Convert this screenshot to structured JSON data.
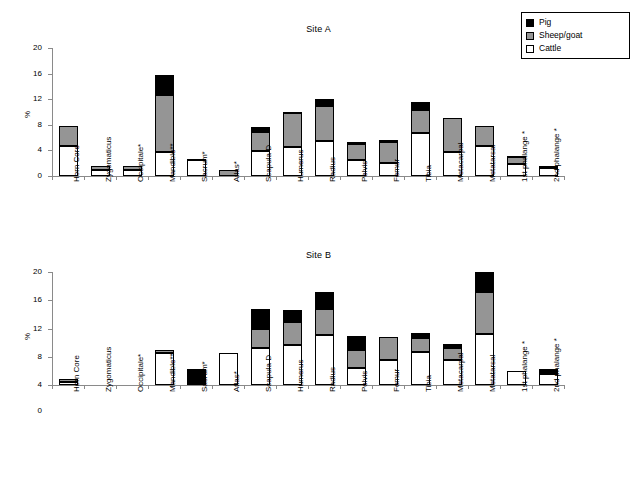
{
  "legend": {
    "position": "top-right",
    "entries": [
      {
        "label": "Pig",
        "color": "#000000",
        "key": "pig"
      },
      {
        "label": "Sheep/goat",
        "color": "#959595",
        "key": "sheep"
      },
      {
        "label": "Cattle",
        "color": "#ffffff",
        "key": "cattle"
      }
    ]
  },
  "chart_data": [
    {
      "type": "bar",
      "stacked": true,
      "title": "Site A",
      "xlabel": "",
      "ylabel": "%",
      "ylim": [
        0,
        20
      ],
      "yticks": [
        0,
        4,
        8,
        12,
        16,
        20
      ],
      "ytick_labels": [
        "0",
        "4",
        "8",
        "12",
        "16",
        "20"
      ],
      "grid": false,
      "axis_baseline_value": 0,
      "categories": [
        "Horn Core",
        "Zygomaticus",
        "Occipitale*",
        "Mandible**",
        "Sacrum*",
        "Atlas*",
        "Scapula D",
        "Humerus",
        "Radius",
        "Pelvis",
        "Femur",
        "Tibia",
        "Metacarpal",
        "Metatarsal",
        "1st  phalange *",
        "2nd phalange *"
      ],
      "series": [
        {
          "name": "Cattle",
          "color": "#ffffff",
          "values": [
            4.7,
            0.9,
            0.9,
            3.7,
            2.6,
            0.0,
            3.9,
            4.5,
            5.5,
            2.5,
            2.1,
            6.7,
            3.8,
            4.7,
            1.8,
            1.2
          ]
        },
        {
          "name": "Sheep/goat",
          "color": "#959595",
          "values": [
            3.1,
            0.6,
            0.6,
            9.0,
            0.1,
            0.9,
            2.9,
            5.4,
            5.4,
            2.5,
            3.2,
            3.6,
            5.3,
            3.1,
            1.1,
            0.3
          ]
        },
        {
          "name": "Pig",
          "color": "#000000",
          "values": [
            0.0,
            0.0,
            0.0,
            3.1,
            0.0,
            0.0,
            0.9,
            0.1,
            1.1,
            0.3,
            0.3,
            1.2,
            0.0,
            0.0,
            0.2,
            0.0
          ]
        }
      ],
      "totals": [
        7.8,
        1.5,
        1.5,
        15.8,
        2.7,
        0.9,
        7.7,
        10.0,
        12.0,
        5.3,
        5.6,
        11.5,
        9.1,
        7.8,
        3.1,
        1.5
      ]
    },
    {
      "type": "bar",
      "stacked": true,
      "title": "Site B",
      "xlabel": "",
      "ylabel": "%",
      "ylim": [
        0,
        20
      ],
      "yticks": [
        0,
        4,
        8,
        12,
        16,
        20
      ],
      "ytick_labels": [
        "0",
        "4",
        "8",
        "12",
        "16",
        "20"
      ],
      "grid": false,
      "axis_baseline_value": 4,
      "categories": [
        "Horn Core",
        "Zygomaticus",
        "Occipitale*",
        "Mandible**",
        "Sacrum*",
        "Atlas*",
        "Scapula D",
        "Humerus",
        "Radius",
        "Pelvis",
        "Femur",
        "Tibia",
        "Metacarpal",
        "Metatarsal",
        "1st  phalange *",
        "2nd phalange *"
      ],
      "series": [
        {
          "name": "Cattle",
          "color": "#ffffff",
          "values": [
            4.4,
            0.0,
            0.0,
            8.6,
            0.0,
            8.5,
            9.2,
            9.6,
            11.1,
            6.4,
            7.5,
            8.7,
            7.5,
            11.2,
            6.0,
            5.6
          ]
        },
        {
          "name": "Sheep/goat",
          "color": "#959595",
          "values": [
            0.5,
            0.0,
            0.0,
            0.4,
            0.0,
            0.0,
            2.7,
            3.3,
            3.6,
            2.6,
            3.3,
            1.9,
            1.8,
            6.0,
            0.0,
            0.0
          ]
        },
        {
          "name": "Pig",
          "color": "#000000",
          "values": [
            0.0,
            0.0,
            0.0,
            0.0,
            6.3,
            0.0,
            2.9,
            1.7,
            2.4,
            1.9,
            0.0,
            0.8,
            0.5,
            2.8,
            0.0,
            0.7
          ]
        }
      ],
      "totals": [
        4.9,
        0.0,
        0.0,
        9.0,
        6.3,
        8.5,
        14.8,
        14.6,
        17.1,
        10.9,
        10.8,
        11.4,
        9.8,
        20.0,
        6.0,
        6.3
      ]
    }
  ]
}
